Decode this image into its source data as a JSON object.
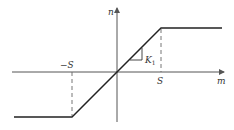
{
  "diagram": {
    "type": "saturation-nonlinearity",
    "x_axis_label": "m",
    "y_axis_label": "n",
    "pos_threshold_label": "S",
    "neg_threshold_label": "−S",
    "slope_label_main": "K",
    "slope_label_sub": "1",
    "colors": {
      "line": "#222222",
      "axis": "#555555",
      "dashed": "#666666",
      "text": "#333333"
    }
  }
}
